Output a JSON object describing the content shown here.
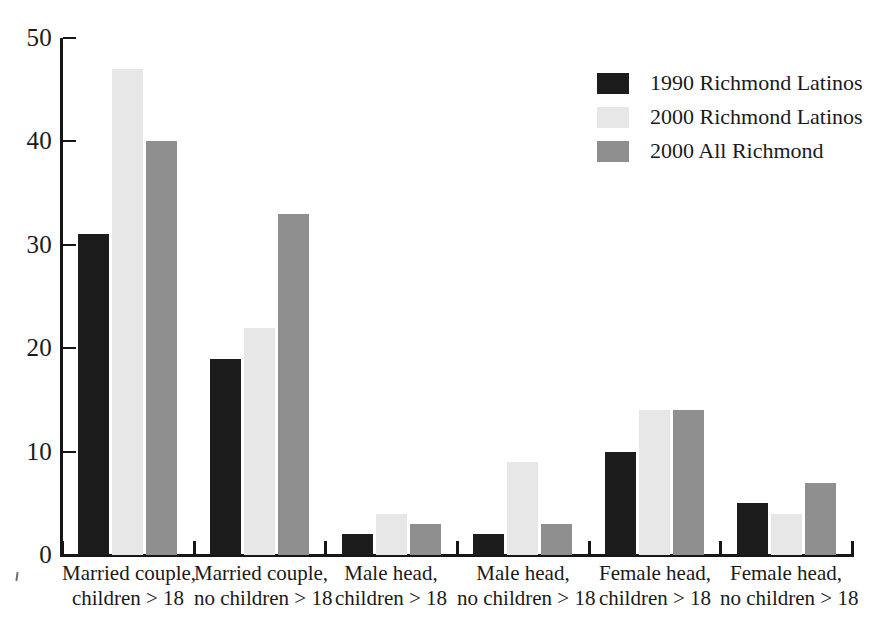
{
  "chart_data": {
    "type": "bar",
    "title": "",
    "subtitle": "",
    "xlabel": "",
    "ylabel": "",
    "ylim": [
      0,
      50
    ],
    "yticks": [
      0,
      10,
      20,
      30,
      40,
      50
    ],
    "ytick_labels": [
      "0",
      "10",
      "20",
      "30",
      "40",
      "50"
    ],
    "grid": false,
    "legend_position": "top-right",
    "categories": [
      "Married couple, children > 18",
      "Married couple, no children > 18",
      "Male head, children > 18",
      "Male head, no children > 18",
      "Female head, children > 18",
      "Female head, no children > 18"
    ],
    "category_lines": [
      [
        "Married couple,",
        "children > 18"
      ],
      [
        "Married couple,",
        "no children > 18"
      ],
      [
        "Male head,",
        "children > 18"
      ],
      [
        "Male head,",
        "no children > 18"
      ],
      [
        "Female head,",
        "children > 18"
      ],
      [
        "Female head,",
        "no children > 18"
      ]
    ],
    "series": [
      {
        "name": "1990 Richmond Latinos",
        "color": "#1c1c1c",
        "values": [
          31,
          19,
          2,
          2,
          10,
          5
        ]
      },
      {
        "name": "2000 Richmond Latinos",
        "color": "#e7e7e7",
        "values": [
          47,
          22,
          4,
          9,
          14,
          4
        ]
      },
      {
        "name": "2000 All Richmond",
        "color": "#8f8f8f",
        "values": [
          40,
          33,
          3,
          3,
          14,
          7
        ]
      }
    ]
  },
  "legend": {
    "items": [
      {
        "label": "1990 Richmond Latinos",
        "swatch": "black-swatch"
      },
      {
        "label": "2000 Richmond Latinos",
        "swatch": "light-gray-swatch"
      },
      {
        "label": "2000 All Richmond",
        "swatch": "medium-gray-swatch"
      }
    ]
  },
  "axes": {
    "y_tick_labels": [
      "50",
      "40",
      "30",
      "20",
      "10",
      "0"
    ]
  }
}
